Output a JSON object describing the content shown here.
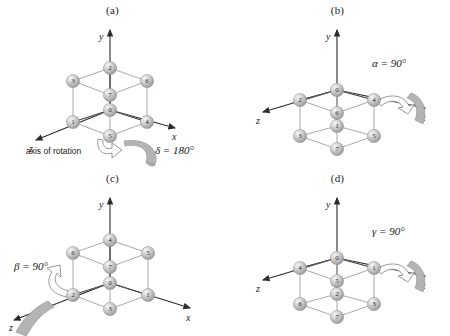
{
  "figure": {
    "type": "cube-rotation-diagram",
    "sphere_color": "#c9c9c9",
    "axis_color": "#2b2b2b",
    "edge_color": "#9a9a9a",
    "ribbon_color": "#b4b4b4"
  },
  "panels": [
    {
      "label": "(a)",
      "axes": {
        "x": "x",
        "y": "y",
        "z": "z"
      },
      "view": "origin-center",
      "angle_symbol": "δ",
      "angle_text": "δ = 180°",
      "rotation_axis_note": "axis of rotation",
      "rotation_about": "z",
      "nodes": [
        {
          "id": "2",
          "pos": "top-back-center"
        },
        {
          "id": "3",
          "pos": "top-left"
        },
        {
          "id": "6",
          "pos": "top-right"
        },
        {
          "id": "7",
          "pos": "mid-center-upper"
        },
        {
          "id": "0",
          "pos": "origin"
        },
        {
          "id": "1",
          "pos": "bottom-left"
        },
        {
          "id": "4",
          "pos": "bottom-right"
        },
        {
          "id": "5",
          "pos": "bottom-front-center"
        }
      ]
    },
    {
      "label": "(b)",
      "axes": {
        "x": "x",
        "y": "y",
        "z": "z"
      },
      "view": "below-origin",
      "angle_symbol": "α",
      "angle_text": "α = 90°",
      "rotation_axis_note": "",
      "rotation_about": "x",
      "nodes": [
        {
          "id": "0",
          "pos": "origin"
        },
        {
          "id": "2",
          "pos": "top-left"
        },
        {
          "id": "4",
          "pos": "top-right"
        },
        {
          "id": "6",
          "pos": "mid-center-upper"
        },
        {
          "id": "1",
          "pos": "mid-center-lower"
        },
        {
          "id": "3",
          "pos": "bottom-left"
        },
        {
          "id": "5",
          "pos": "bottom-right"
        },
        {
          "id": "7",
          "pos": "bottom-front-center"
        }
      ]
    },
    {
      "label": "(c)",
      "axes": {
        "x": "x",
        "y": "y",
        "z": "z"
      },
      "view": "origin-center",
      "angle_symbol": "β",
      "angle_text": "β = 90°",
      "rotation_axis_note": "",
      "rotation_about": "z",
      "nodes": [
        {
          "id": "4",
          "pos": "top-back-center"
        },
        {
          "id": "6",
          "pos": "top-left"
        },
        {
          "id": "5",
          "pos": "top-right"
        },
        {
          "id": "7",
          "pos": "mid-center-upper"
        },
        {
          "id": "0",
          "pos": "origin"
        },
        {
          "id": "2",
          "pos": "bottom-left"
        },
        {
          "id": "1",
          "pos": "bottom-right"
        },
        {
          "id": "3",
          "pos": "bottom-front-center"
        }
      ]
    },
    {
      "label": "(d)",
      "axes": {
        "x": "x",
        "y": "y",
        "z": "z"
      },
      "view": "below-origin",
      "angle_symbol": "γ",
      "angle_text": "γ = 90°",
      "rotation_axis_note": "",
      "rotation_about": "x",
      "nodes": [
        {
          "id": "0",
          "pos": "origin"
        },
        {
          "id": "4",
          "pos": "top-left"
        },
        {
          "id": "1",
          "pos": "top-right"
        },
        {
          "id": "5",
          "pos": "mid-center-upper"
        },
        {
          "id": "2",
          "pos": "mid-center-lower"
        },
        {
          "id": "6",
          "pos": "bottom-left"
        },
        {
          "id": "3",
          "pos": "bottom-right"
        },
        {
          "id": "7",
          "pos": "bottom-front-center"
        }
      ]
    }
  ]
}
